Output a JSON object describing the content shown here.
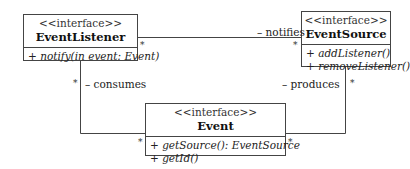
{
  "diagram": {
    "type": "UML class diagram",
    "classes": [
      {
        "id": "event-listener",
        "stereotype": "<<interface>>",
        "name": "EventListener",
        "operations": [
          "+ notify(in event: Event)"
        ]
      },
      {
        "id": "event-source",
        "stereotype": "<<interface>>",
        "name": "EventSource",
        "operations": [
          "+ addListener()",
          "+ removeListener()"
        ]
      },
      {
        "id": "event",
        "stereotype": "<<interface>>",
        "name": "Event",
        "operations": [
          "+ getSource(): EventSource",
          "+ getId()"
        ]
      }
    ],
    "associations": [
      {
        "from": "EventListener",
        "to": "EventSource",
        "role": "– notifies",
        "from_multiplicity": "*",
        "to_multiplicity": "*"
      },
      {
        "from": "EventListener",
        "to": "Event",
        "role": "– consumes",
        "from_multiplicity": "*",
        "to_multiplicity": "*"
      },
      {
        "from": "EventSource",
        "to": "Event",
        "role": "– produces",
        "from_multiplicity": "*",
        "to_multiplicity": "*"
      }
    ]
  }
}
